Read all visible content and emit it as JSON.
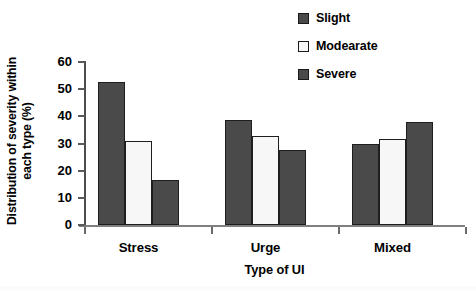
{
  "chart_data": {
    "type": "bar",
    "title": "",
    "subtitle": "",
    "xlabel": "Type of UI",
    "ylabel": "Distribution of severity within each type (%)",
    "ylabel_lines": [
      "Distribution of severity within",
      "each type (%)"
    ],
    "categories": [
      "Stress",
      "Urge",
      "Mixed"
    ],
    "series": [
      {
        "name": "Slight",
        "color": "#4a4a4a",
        "values": [
          52.8,
          38.6,
          29.9
        ]
      },
      {
        "name": "Modearate",
        "color": "#f7f7f7",
        "values": [
          30.8,
          32.7,
          31.7
        ]
      },
      {
        "name": "Severe",
        "color": "#4a4a4a",
        "values": [
          16.6,
          27.5,
          37.8
        ]
      }
    ],
    "ylim": [
      0,
      60
    ],
    "ytick_labels": [
      "0",
      "10",
      "20",
      "30",
      "40",
      "50",
      "60"
    ],
    "ytick_values": [
      0,
      10,
      20,
      30,
      40,
      50,
      60
    ],
    "grid": false,
    "legend_position": "top-right",
    "legend_entries": [
      "Slight",
      "Modearate",
      "Severe"
    ],
    "bar_border_color": "#1e1e1e",
    "axis_color": "#5a5a5a"
  },
  "legend": {
    "items": [
      {
        "label": "Slight",
        "swatch_name": "legend-swatch-slight"
      },
      {
        "label": "Modearate",
        "swatch_name": "legend-swatch-moderate"
      },
      {
        "label": "Severe",
        "swatch_name": "legend-swatch-severe"
      }
    ]
  }
}
